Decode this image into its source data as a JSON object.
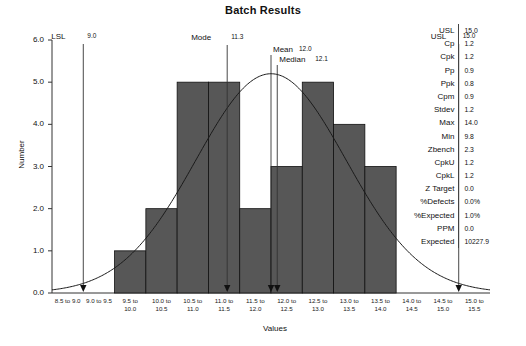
{
  "chart_data": {
    "type": "bar",
    "title": "Batch Results",
    "xlabel": "Values",
    "ylabel": "Number",
    "ylim": [
      0,
      6
    ],
    "yticks": [
      "0.0",
      "1.0",
      "2.0",
      "3.0",
      "4.0",
      "5.0",
      "6.0"
    ],
    "grid": false,
    "legend": "none",
    "categories": [
      "8.5 to 9.0",
      "9.0 to 9.5",
      "9.5 to 10.0",
      "10.0 to 10.5",
      "10.5 to 11.0",
      "11.0 to 11.5",
      "11.5 to 12.0",
      "12.0 to 12.5",
      "12.5 to 13.0",
      "13.0 to 13.5",
      "13.5 to 14.0",
      "14.0 to 14.5",
      "14.5 to 15.0",
      "15.0 to 15.5"
    ],
    "values": [
      0,
      0,
      1,
      2,
      5,
      5,
      2,
      3,
      5,
      4,
      3,
      0,
      0,
      0
    ],
    "overlay_curve": {
      "name": "normal-distribution",
      "mean": 12.0,
      "stdev": 1.2,
      "peak_height": 5.2
    },
    "markers": [
      {
        "name": "LSL",
        "value": "9.0",
        "x": 9.0
      },
      {
        "name": "Mode",
        "value": "11.3",
        "x": 11.3
      },
      {
        "name": "Mean",
        "value": "12.0",
        "x": 12.0
      },
      {
        "name": "Median",
        "value": "12.1",
        "x": 12.1
      },
      {
        "name": "USL",
        "value": "15.0",
        "x": 15.0
      }
    ],
    "bar_color": "#575757",
    "curve_color": "#1a1a1a"
  },
  "stats": {
    "rows": [
      {
        "label": "USL",
        "value": "15.0"
      },
      {
        "label": "Cp",
        "value": "1.2"
      },
      {
        "label": "Cpk",
        "value": "1.2"
      },
      {
        "label": "Pp",
        "value": "0.9"
      },
      {
        "label": "Ppk",
        "value": "0.8"
      },
      {
        "label": "Cpm",
        "value": "0.9"
      },
      {
        "label": "Stdev",
        "value": "1.2"
      },
      {
        "label": "Max",
        "value": "14.0"
      },
      {
        "label": "Min",
        "value": "9.8"
      },
      {
        "label": "Zbench",
        "value": "2.3"
      },
      {
        "label": "CpkU",
        "value": "1.2"
      },
      {
        "label": "CpkL",
        "value": "1.2"
      },
      {
        "label": "Z Target",
        "value": "0.0"
      },
      {
        "label": "%Defects",
        "value": "0.0%"
      },
      {
        "label": "%Expected",
        "value": "1.0%"
      },
      {
        "label": "PPM",
        "value": "0.0"
      },
      {
        "label": "Expected",
        "value": "10227.9"
      }
    ]
  }
}
